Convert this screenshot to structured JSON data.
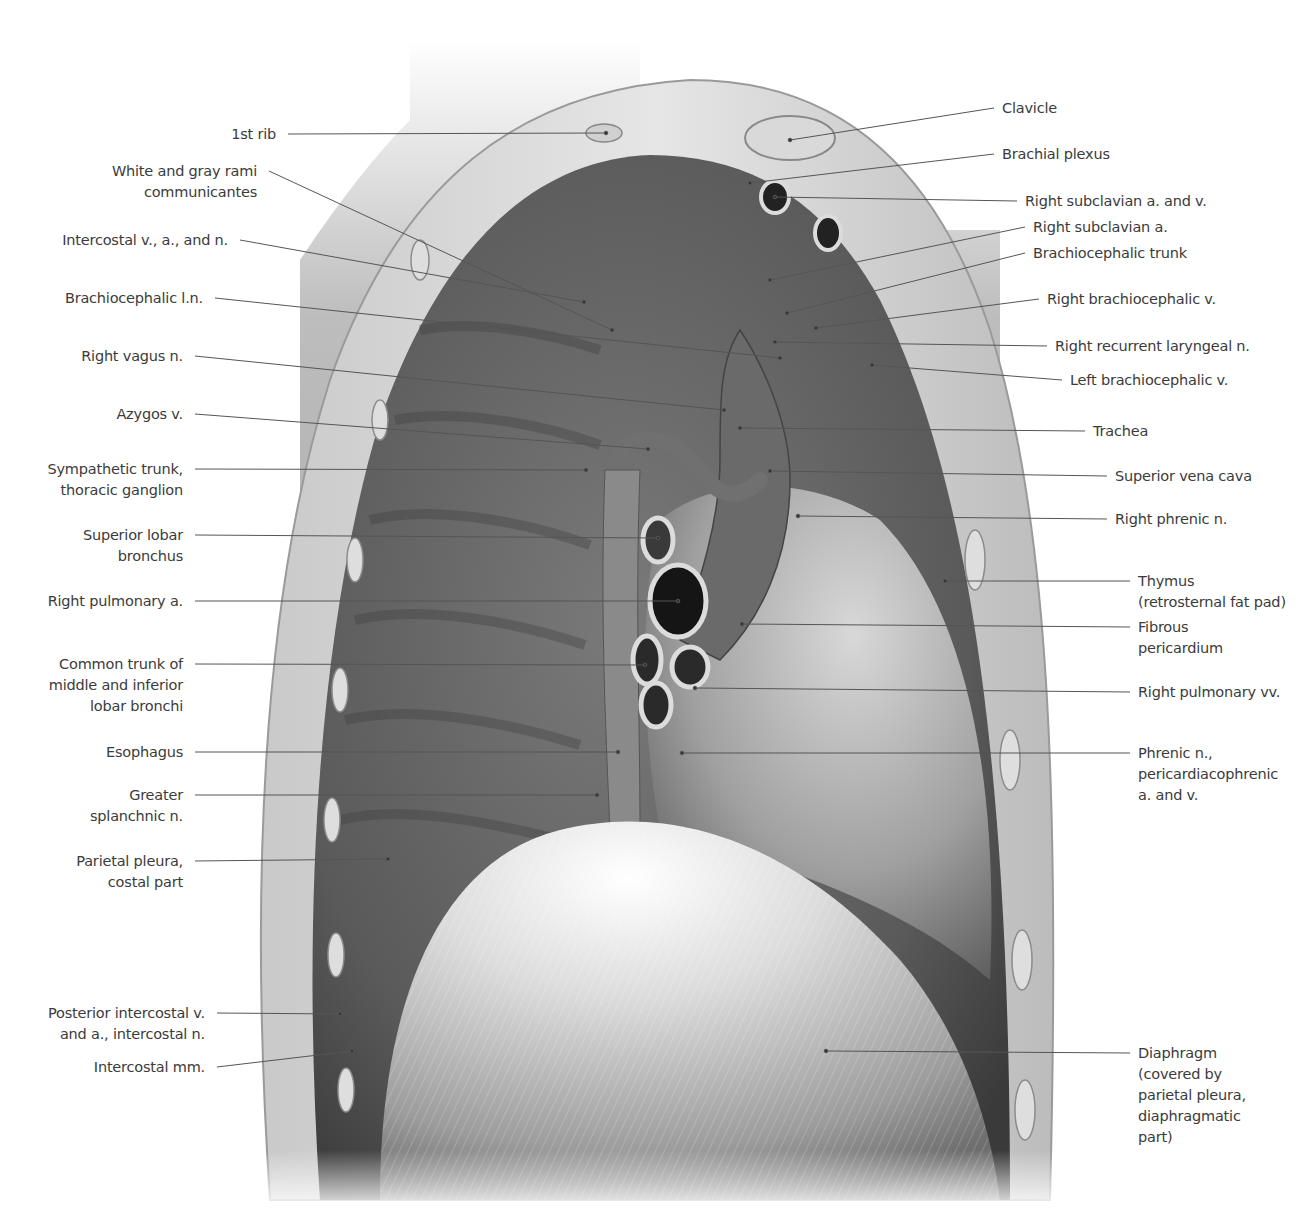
{
  "figure": {
    "colors": {
      "background": "#ffffff",
      "label_text": "#3b3b3b",
      "leader_line": "#555555",
      "tissue_dark": "#4a4a4a",
      "tissue_light": "#d9d9d9"
    }
  },
  "labels_left": [
    {
      "id": "first-rib",
      "text": "1st rib",
      "x": 276,
      "y": 124,
      "tx": 606,
      "ty": 133
    },
    {
      "id": "rami-communicantes",
      "text": "White and gray rami\ncommunicantes",
      "x": 257,
      "y": 161,
      "tx": 612,
      "ty": 330
    },
    {
      "id": "intercostal-van",
      "text": "Intercostal v., a., and n.",
      "x": 228,
      "y": 230,
      "tx": 584,
      "ty": 302
    },
    {
      "id": "brachiocephalic-ln",
      "text": "Brachiocephalic l.n.",
      "x": 203,
      "y": 288,
      "tx": 780,
      "ty": 358
    },
    {
      "id": "right-vagus",
      "text": "Right vagus n.",
      "x": 183,
      "y": 346,
      "tx": 724,
      "ty": 410
    },
    {
      "id": "azygos",
      "text": "Azygos v.",
      "x": 183,
      "y": 404,
      "tx": 648,
      "ty": 449
    },
    {
      "id": "sympathetic-trunk",
      "text": "Sympathetic trunk,\nthoracic ganglion",
      "x": 183,
      "y": 459,
      "tx": 586,
      "ty": 470
    },
    {
      "id": "superior-lobar-bronchus",
      "text": "Superior lobar\nbronchus",
      "x": 183,
      "y": 525,
      "tx": 658,
      "ty": 538
    },
    {
      "id": "right-pulmonary-a",
      "text": "Right pulmonary a.",
      "x": 183,
      "y": 591,
      "tx": 678,
      "ty": 601
    },
    {
      "id": "common-trunk-bronchi",
      "text": "Common trunk of\nmiddle and inferior\nlobar bronchi",
      "x": 183,
      "y": 654,
      "tx": 645,
      "ty": 665
    },
    {
      "id": "esophagus",
      "text": "Esophagus",
      "x": 183,
      "y": 742,
      "tx": 618,
      "ty": 752
    },
    {
      "id": "greater-splanchnic",
      "text": "Greater\nsplanchnic n.",
      "x": 183,
      "y": 785,
      "tx": 597,
      "ty": 795
    },
    {
      "id": "parietal-pleura-costal",
      "text": "Parietal pleura,\ncostal part",
      "x": 183,
      "y": 851,
      "tx": 388,
      "ty": 859
    },
    {
      "id": "posterior-intercostal",
      "text": "Posterior intercostal v.\nand a., intercostal n.",
      "x": 205,
      "y": 1003,
      "tx": 340,
      "ty": 1014
    },
    {
      "id": "intercostal-mm",
      "text": "Intercostal mm.",
      "x": 205,
      "y": 1057,
      "tx": 352,
      "ty": 1051
    }
  ],
  "labels_right": [
    {
      "id": "clavicle",
      "text": "Clavicle",
      "x": 1002,
      "y": 98,
      "tx": 790,
      "ty": 140
    },
    {
      "id": "brachial-plexus",
      "text": "Brachial plexus",
      "x": 1002,
      "y": 144,
      "tx": 750,
      "ty": 183
    },
    {
      "id": "right-subclavian-av",
      "text": "Right subclavian a. and v.",
      "x": 1025,
      "y": 191,
      "tx": 775,
      "ty": 197
    },
    {
      "id": "right-subclavian-a",
      "text": "Right subclavian a.",
      "x": 1033,
      "y": 217,
      "tx": 770,
      "ty": 280
    },
    {
      "id": "brachiocephalic-trunk",
      "text": "Brachiocephalic trunk",
      "x": 1033,
      "y": 243,
      "tx": 787,
      "ty": 313
    },
    {
      "id": "right-brachiocephalic-v",
      "text": "Right brachiocephalic v.",
      "x": 1047,
      "y": 289,
      "tx": 816,
      "ty": 328
    },
    {
      "id": "right-recurrent-laryngeal",
      "text": "Right recurrent laryngeal n.",
      "x": 1055,
      "y": 336,
      "tx": 775,
      "ty": 342
    },
    {
      "id": "left-brachiocephalic-v",
      "text": "Left brachiocephalic v.",
      "x": 1070,
      "y": 370,
      "tx": 872,
      "ty": 365
    },
    {
      "id": "trachea",
      "text": "Trachea",
      "x": 1093,
      "y": 421,
      "tx": 740,
      "ty": 428
    },
    {
      "id": "superior-vena-cava",
      "text": "Superior vena cava",
      "x": 1115,
      "y": 466,
      "tx": 770,
      "ty": 471
    },
    {
      "id": "right-phrenic",
      "text": "Right phrenic n.",
      "x": 1115,
      "y": 509,
      "tx": 798,
      "ty": 516
    },
    {
      "id": "thymus",
      "text": "Thymus\n(retrosternal fat pad)",
      "x": 1138,
      "y": 571,
      "tx": 945,
      "ty": 581
    },
    {
      "id": "fibrous-pericardium",
      "text": "Fibrous\npericardium",
      "x": 1138,
      "y": 617,
      "tx": 742,
      "ty": 624
    },
    {
      "id": "right-pulmonary-vv",
      "text": "Right pulmonary vv.",
      "x": 1138,
      "y": 682,
      "tx": 695,
      "ty": 688
    },
    {
      "id": "phrenic-pericardiacophrenic",
      "text": "Phrenic n.,\npericardiacophrenic\na. and v.",
      "x": 1138,
      "y": 743,
      "tx": 682,
      "ty": 753
    },
    {
      "id": "diaphragm",
      "text": "Diaphragm\n(covered by\nparietal pleura,\ndiaphragmatic\npart)",
      "x": 1138,
      "y": 1043,
      "tx": 826,
      "ty": 1051
    }
  ]
}
